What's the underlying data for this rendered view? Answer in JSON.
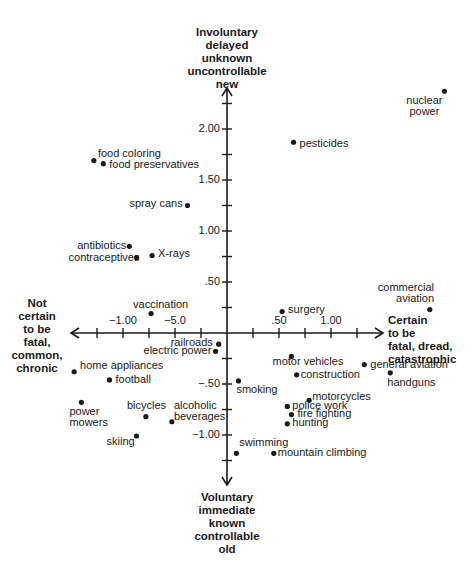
{
  "chart_data": {
    "type": "scatter",
    "title": "",
    "xlabel_left": "Not certain to be fatal, common, chronic",
    "xlabel_right": "Certain to be fatal, dread, catastrophic",
    "ylabel_top": "Involuntary delayed unknown uncontrollable new",
    "ylabel_bottom": "Voluntary immediate known controllable old",
    "x_tick_labels": [
      {
        "value": -1.0,
        "label": "−1.00"
      },
      {
        "value": -0.5,
        "label": "−5.0"
      },
      {
        "value": 0.5,
        "label": ".50"
      },
      {
        "value": 1.0,
        "label": "1.00"
      }
    ],
    "y_tick_labels": [
      {
        "value": 2.0,
        "label": "2.00"
      },
      {
        "value": 1.5,
        "label": "1.50"
      },
      {
        "value": 1.0,
        "label": "1.00"
      },
      {
        "value": 0.5,
        "label": ".50"
      },
      {
        "value": -0.5,
        "label": "−.50"
      },
      {
        "value": -1.0,
        "label": "−1.00"
      }
    ],
    "x_ticks": [
      -1.25,
      -1.0,
      -0.75,
      -0.5,
      -0.25,
      0.25,
      0.5,
      0.75,
      1.0,
      1.25
    ],
    "y_ticks": [
      2.25,
      2.0,
      1.75,
      1.5,
      1.25,
      1.0,
      0.75,
      0.5,
      0.25,
      -0.25,
      -0.5,
      -0.75,
      -1.0,
      -1.25
    ],
    "xlim": [
      -1.5,
      1.45
    ],
    "ylim": [
      -1.45,
      2.4
    ],
    "grid": false,
    "legend": null,
    "points": [
      {
        "name": "nuclear power",
        "label_lines": [
          "nuclear",
          "power"
        ],
        "x": 2.09,
        "y": 2.37,
        "lx": -38,
        "ly": 4,
        "align": "center"
      },
      {
        "name": "pesticides",
        "label_lines": [
          "pesticides"
        ],
        "x": 0.64,
        "y": 1.87,
        "lx": 6,
        "ly": -4
      },
      {
        "name": "food coloring",
        "label_lines": [
          "food coloring"
        ],
        "x": -1.28,
        "y": 1.69,
        "lx": 4,
        "ly": -13
      },
      {
        "name": "food preservatives",
        "label_lines": [
          "food preservatives"
        ],
        "x": -1.19,
        "y": 1.66,
        "lx": 6,
        "ly": -5
      },
      {
        "name": "spray cans",
        "label_lines": [
          "spray cans"
        ],
        "x": -0.38,
        "y": 1.25,
        "lx": -58,
        "ly": -8
      },
      {
        "name": "antibiotics",
        "label_lines": [
          "antibiotics"
        ],
        "x": -0.94,
        "y": 0.85,
        "lx": -52,
        "ly": -6
      },
      {
        "name": "contraceptives",
        "label_lines": [
          "contraceptives"
        ],
        "x": -0.87,
        "y": 0.74,
        "lx": -68,
        "ly": -6
      },
      {
        "name": "X-rays",
        "label_lines": [
          "X-rays"
        ],
        "x": -0.72,
        "y": 0.76,
        "lx": 6,
        "ly": -7
      },
      {
        "name": "vaccination",
        "label_lines": [
          "vaccination"
        ],
        "x": -0.73,
        "y": 0.19,
        "lx": -18,
        "ly": -15
      },
      {
        "name": "surgery",
        "label_lines": [
          "surgery"
        ],
        "x": 0.53,
        "y": 0.21,
        "lx": 6,
        "ly": -8
      },
      {
        "name": "commercial aviation",
        "label_lines": [
          "commercial",
          "aviation"
        ],
        "x": 1.95,
        "y": 0.23,
        "lx": -52,
        "ly": -28,
        "align": "right"
      },
      {
        "name": "railroads",
        "label_lines": [
          "railroads"
        ],
        "x": -0.08,
        "y": -0.11,
        "lx": -48,
        "ly": -7
      },
      {
        "name": "electric power",
        "label_lines": [
          "electric power"
        ],
        "x": -0.11,
        "y": -0.18,
        "lx": -72,
        "ly": -6
      },
      {
        "name": "motor vehicles",
        "label_lines": [
          "motor vehicles"
        ],
        "x": 0.62,
        "y": -0.23,
        "lx": -19,
        "ly": 0
      },
      {
        "name": "construction",
        "label_lines": [
          "construction"
        ],
        "x": 0.67,
        "y": -0.41,
        "lx": 4,
        "ly": -6
      },
      {
        "name": "general aviation",
        "label_lines": [
          "general aviation"
        ],
        "x": 1.32,
        "y": -0.31,
        "lx": 6,
        "ly": -6
      },
      {
        "name": "handguns",
        "label_lines": [
          "handguns"
        ],
        "x": 1.57,
        "y": -0.39,
        "lx": -3,
        "ly": 4
      },
      {
        "name": "smoking",
        "label_lines": [
          "smoking"
        ],
        "x": 0.11,
        "y": -0.47,
        "lx": -2,
        "ly": 3
      },
      {
        "name": "home appliances",
        "label_lines": [
          "home appliances"
        ],
        "x": -1.47,
        "y": -0.38,
        "lx": 6,
        "ly": -12
      },
      {
        "name": "football",
        "label_lines": [
          "football"
        ],
        "x": -1.13,
        "y": -0.46,
        "lx": 6,
        "ly": -6
      },
      {
        "name": "power mowers",
        "label_lines": [
          "power",
          "mowers"
        ],
        "x": -1.4,
        "y": -0.68,
        "lx": -12,
        "ly": 4
      },
      {
        "name": "bicycles",
        "label_lines": [
          "bicycles"
        ],
        "x": -0.78,
        "y": -0.82,
        "lx": -19,
        "ly": -17
      },
      {
        "name": "alcoholic beverages",
        "label_lines": [
          "alcoholic",
          "beverages"
        ],
        "x": -0.53,
        "y": -0.87,
        "lx": 2,
        "ly": -22
      },
      {
        "name": "skiing",
        "label_lines": [
          "skiing"
        ],
        "x": -0.87,
        "y": -1.01,
        "lx": -30,
        "ly": 0
      },
      {
        "name": "motorcycles",
        "label_lines": [
          "motorcycles"
        ],
        "x": 0.79,
        "y": -0.66,
        "lx": 3,
        "ly": -9
      },
      {
        "name": "police work",
        "label_lines": [
          "police work"
        ],
        "x": 0.58,
        "y": -0.72,
        "lx": 5,
        "ly": -6
      },
      {
        "name": "fire fighting",
        "label_lines": [
          "fire fighting"
        ],
        "x": 0.62,
        "y": -0.8,
        "lx": 6,
        "ly": -7
      },
      {
        "name": "hunting",
        "label_lines": [
          "hunting"
        ],
        "x": 0.58,
        "y": -0.89,
        "lx": 5,
        "ly": -7
      },
      {
        "name": "swimming",
        "label_lines": [
          "swimming"
        ],
        "x": 0.09,
        "y": -1.18,
        "lx": 3,
        "ly": -16
      },
      {
        "name": "mountain climbing",
        "label_lines": [
          "mountain climbing"
        ],
        "x": 0.45,
        "y": -1.18,
        "lx": 4,
        "ly": -6
      }
    ],
    "colors": {
      "ink": "#1a1a1a",
      "background": "#ffffff"
    }
  },
  "poles": {
    "top": [
      "Involuntary",
      "delayed",
      "unknown",
      "uncontrollable",
      "new"
    ],
    "bottom": [
      "Voluntary",
      "immediate",
      "known",
      "controllable",
      "old"
    ],
    "left": [
      "Not",
      "certain",
      "to be",
      "fatal,",
      "common,",
      "chronic"
    ],
    "right": [
      "Certain",
      "to be",
      "fatal, dread,",
      "catastrophic"
    ]
  }
}
